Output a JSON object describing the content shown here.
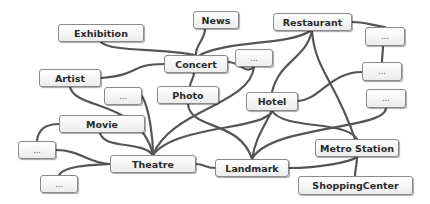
{
  "diagram": {
    "type": "concept-network",
    "nodes": [
      {
        "id": "exhibition",
        "label": "Exhibition",
        "x": 58,
        "y": 24,
        "w": 86,
        "h": 18
      },
      {
        "id": "news",
        "label": "News",
        "x": 193,
        "y": 11,
        "w": 46,
        "h": 18
      },
      {
        "id": "restaurant",
        "label": "Restaurant",
        "x": 273,
        "y": 13,
        "w": 79,
        "h": 18
      },
      {
        "id": "concert",
        "label": "Concert",
        "x": 164,
        "y": 55,
        "w": 64,
        "h": 18
      },
      {
        "id": "e_topmid",
        "label": "...",
        "x": 235,
        "y": 49,
        "w": 38,
        "h": 18
      },
      {
        "id": "e_r1",
        "label": "...",
        "x": 365,
        "y": 27,
        "w": 40,
        "h": 19
      },
      {
        "id": "e_r2",
        "label": "...",
        "x": 362,
        "y": 62,
        "w": 40,
        "h": 19
      },
      {
        "id": "e_r3",
        "label": "...",
        "x": 366,
        "y": 89,
        "w": 40,
        "h": 19
      },
      {
        "id": "artist",
        "label": "Artist",
        "x": 39,
        "y": 69,
        "w": 62,
        "h": 18
      },
      {
        "id": "e_lm",
        "label": "...",
        "x": 104,
        "y": 87,
        "w": 38,
        "h": 18
      },
      {
        "id": "photo",
        "label": "Photo",
        "x": 157,
        "y": 86,
        "w": 62,
        "h": 18
      },
      {
        "id": "hotel",
        "label": "Hotel",
        "x": 246,
        "y": 92,
        "w": 52,
        "h": 19
      },
      {
        "id": "movie",
        "label": "Movie",
        "x": 59,
        "y": 115,
        "w": 86,
        "h": 18
      },
      {
        "id": "e_l1",
        "label": "...",
        "x": 18,
        "y": 141,
        "w": 38,
        "h": 18
      },
      {
        "id": "theatre",
        "label": "Theatre",
        "x": 110,
        "y": 155,
        "w": 86,
        "h": 18
      },
      {
        "id": "landmark",
        "label": "Landmark",
        "x": 215,
        "y": 159,
        "w": 74,
        "h": 18
      },
      {
        "id": "metro",
        "label": "Metro Station",
        "x": 315,
        "y": 139,
        "w": 84,
        "h": 18
      },
      {
        "id": "e_l2",
        "label": "...",
        "x": 40,
        "y": 175,
        "w": 38,
        "h": 18
      },
      {
        "id": "shopping",
        "label": "ShoppingCenter",
        "x": 298,
        "y": 176,
        "w": 115,
        "h": 19
      }
    ],
    "edges": [
      [
        "exhibition",
        "concert"
      ],
      [
        "news",
        "concert"
      ],
      [
        "restaurant",
        "concert"
      ],
      [
        "concert",
        "artist"
      ],
      [
        "concert",
        "photo"
      ],
      [
        "concert",
        "e_topmid"
      ],
      [
        "restaurant",
        "e_r1"
      ],
      [
        "e_r1",
        "e_r2"
      ],
      [
        "e_r2",
        "hotel"
      ],
      [
        "restaurant",
        "hotel"
      ],
      [
        "restaurant",
        "metro"
      ],
      [
        "artist",
        "theatre"
      ],
      [
        "e_lm",
        "theatre"
      ],
      [
        "photo",
        "landmark"
      ],
      [
        "e_topmid",
        "theatre"
      ],
      [
        "hotel",
        "theatre"
      ],
      [
        "hotel",
        "landmark"
      ],
      [
        "hotel",
        "metro"
      ],
      [
        "e_r3",
        "landmark"
      ],
      [
        "movie",
        "theatre"
      ],
      [
        "movie",
        "e_l1"
      ],
      [
        "e_l1",
        "theatre"
      ],
      [
        "e_l2",
        "theatre"
      ],
      [
        "theatre",
        "landmark"
      ],
      [
        "landmark",
        "metro"
      ],
      [
        "metro",
        "shopping"
      ]
    ]
  }
}
